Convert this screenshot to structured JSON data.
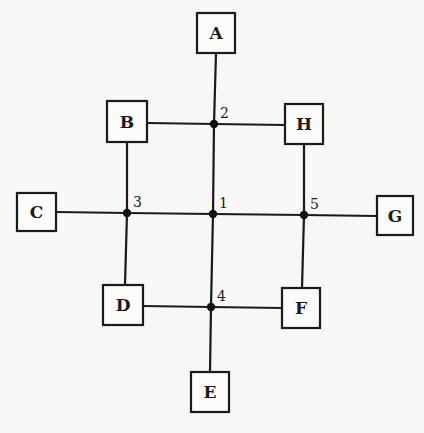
{
  "diagram": {
    "title": "",
    "boxes": [
      {
        "id": "A",
        "label": "A",
        "x": 197,
        "y": 13,
        "w": 38,
        "h": 40
      },
      {
        "id": "B",
        "label": "B",
        "x": 107,
        "y": 101,
        "w": 40,
        "h": 41
      },
      {
        "id": "H",
        "label": "H",
        "x": 285,
        "y": 104,
        "w": 38,
        "h": 40
      },
      {
        "id": "C",
        "label": "C",
        "x": 17,
        "y": 193,
        "w": 39,
        "h": 38
      },
      {
        "id": "G",
        "label": "G",
        "x": 377,
        "y": 196,
        "w": 36,
        "h": 39
      },
      {
        "id": "D",
        "label": "D",
        "x": 103,
        "y": 285,
        "w": 40,
        "h": 40
      },
      {
        "id": "F",
        "label": "F",
        "x": 282,
        "y": 288,
        "w": 38,
        "h": 40
      },
      {
        "id": "E",
        "label": "E",
        "x": 191,
        "y": 372,
        "w": 38,
        "h": 40
      }
    ],
    "junctions": [
      {
        "id": "1",
        "label": "1",
        "x": 213,
        "y": 214
      },
      {
        "id": "2",
        "label": "2",
        "x": 214,
        "y": 124
      },
      {
        "id": "3",
        "label": "3",
        "x": 127,
        "y": 213
      },
      {
        "id": "4",
        "label": "4",
        "x": 211,
        "y": 307
      },
      {
        "id": "5",
        "label": "5",
        "x": 304,
        "y": 215
      }
    ],
    "edges": [
      {
        "from": "A",
        "to": "2",
        "x1": 216,
        "y1": 53,
        "x2": 214,
        "y2": 124
      },
      {
        "from": "2",
        "to": "1",
        "x1": 214,
        "y1": 124,
        "x2": 213,
        "y2": 214
      },
      {
        "from": "1",
        "to": "4",
        "x1": 213,
        "y1": 214,
        "x2": 211,
        "y2": 307
      },
      {
        "from": "4",
        "to": "E",
        "x1": 211,
        "y1": 307,
        "x2": 210,
        "y2": 372
      },
      {
        "from": "B",
        "to": "2",
        "x1": 147,
        "y1": 123,
        "x2": 214,
        "y2": 124
      },
      {
        "from": "2",
        "to": "H",
        "x1": 214,
        "y1": 124,
        "x2": 285,
        "y2": 125
      },
      {
        "from": "C",
        "to": "3",
        "x1": 56,
        "y1": 212,
        "x2": 127,
        "y2": 213
      },
      {
        "from": "3",
        "to": "1",
        "x1": 127,
        "y1": 213,
        "x2": 213,
        "y2": 214
      },
      {
        "from": "1",
        "to": "5",
        "x1": 213,
        "y1": 214,
        "x2": 304,
        "y2": 215
      },
      {
        "from": "5",
        "to": "G",
        "x1": 304,
        "y1": 215,
        "x2": 377,
        "y2": 216
      },
      {
        "from": "B",
        "to": "3",
        "x1": 127,
        "y1": 142,
        "x2": 127,
        "y2": 213
      },
      {
        "from": "3",
        "to": "D",
        "x1": 127,
        "y1": 213,
        "x2": 125,
        "y2": 285
      },
      {
        "from": "H",
        "to": "5",
        "x1": 304,
        "y1": 144,
        "x2": 304,
        "y2": 215
      },
      {
        "from": "5",
        "to": "F",
        "x1": 304,
        "y1": 215,
        "x2": 302,
        "y2": 288
      },
      {
        "from": "D",
        "to": "4",
        "x1": 143,
        "y1": 306,
        "x2": 211,
        "y2": 307
      },
      {
        "from": "4",
        "to": "F",
        "x1": 211,
        "y1": 307,
        "x2": 282,
        "y2": 308
      }
    ]
  }
}
